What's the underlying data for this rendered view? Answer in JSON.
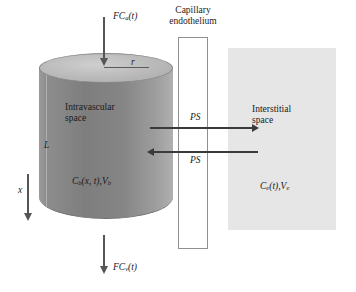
{
  "figure": {
    "colors": {
      "cylinder_body": "#858585",
      "cylinder_top": "#bdbdbd",
      "interstitial_block": "#e6e6e6",
      "endothelium_fill": "#ffffff",
      "endothelium_border": "#8f8f8f",
      "arrow": "#3a3a3a",
      "flow_arrow": "#555555",
      "text": "#1a1a1a",
      "background": "#ffffff"
    }
  },
  "labels": {
    "arterial_inflow": "FCa(t)",
    "arterial_inflow_base": "FC",
    "arterial_inflow_sub": "a",
    "arterial_inflow_tail": "(t)",
    "venous_outflow_base": "FC",
    "venous_outflow_sub": "v",
    "venous_outflow_tail": "(t)",
    "endothelium_line1": "Capillary",
    "endothelium_line2": "endothelium",
    "radius": "r",
    "length": "L",
    "axis": "x",
    "intravascular_line1": "Intravascular",
    "intravascular_line2": "space",
    "interstitial_line1": "Interstitial",
    "interstitial_line2": "space",
    "blood_conc_base": "C",
    "blood_conc_sub": "b",
    "blood_conc_args": "(x, t),",
    "blood_vol_base": "V",
    "blood_vol_sub": "b",
    "ees_conc_base": "C",
    "ees_conc_sub": "e",
    "ees_conc_args": "(t),",
    "ees_vol_base": "V",
    "ees_vol_sub": "e",
    "permeability_influx": "PS",
    "permeability_efflux": "PS"
  }
}
